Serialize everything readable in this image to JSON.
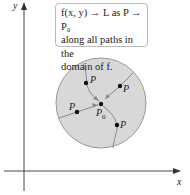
{
  "axes": {
    "x_label": "x",
    "y_label": "y"
  },
  "callout": {
    "line1": "f(x, y) → L as P → P₀",
    "line2": "along all paths in the",
    "line3": "domain of f."
  },
  "points": {
    "moving": "P",
    "limit": "P",
    "limit_sub": "0"
  },
  "colors": {
    "disk_fill": "#d8d8d8",
    "disk_stroke": "#999999",
    "path": "#888888",
    "point": "#111111"
  }
}
